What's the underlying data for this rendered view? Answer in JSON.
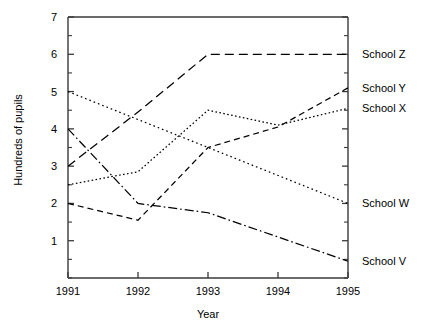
{
  "chart_data": {
    "type": "line",
    "title": "",
    "xlabel": "Year",
    "ylabel": "Hundreds of pupils",
    "x": [
      1991,
      1992,
      1993,
      1994,
      1995
    ],
    "xtick_labels": [
      "1991",
      "1992",
      "1993",
      "1994",
      "1995"
    ],
    "ytick_labels": [
      "1",
      "2",
      "3",
      "4",
      "5",
      "6",
      "7"
    ],
    "ytick_values": [
      1,
      2,
      3,
      4,
      5,
      6,
      7
    ],
    "xlim": [
      1991,
      1995
    ],
    "ylim": [
      0,
      7
    ],
    "y_minor_step": 0.5,
    "grid": false,
    "legend_position": "right-of-axes-inline",
    "series": [
      {
        "name": "School Z",
        "label": "School Z",
        "line_style": "dashed",
        "values": [
          3,
          4.45,
          6,
          6,
          6
        ]
      },
      {
        "name": "School Y",
        "label": "School Y",
        "line_style": "dashed-short",
        "values": [
          2,
          1.55,
          3.5,
          4.05,
          5.1
        ]
      },
      {
        "name": "School X",
        "label": "School X",
        "line_style": "dotted-dense",
        "values": [
          2.5,
          2.85,
          4.5,
          4.1,
          4.55
        ]
      },
      {
        "name": "School W",
        "label": "School W",
        "line_style": "dotted",
        "values": [
          5,
          4.25,
          3.5,
          2.75,
          2
        ]
      },
      {
        "name": "School V",
        "label": "School V",
        "line_style": "dash-dot",
        "values": [
          4,
          2,
          1.75,
          1.1,
          0.45
        ]
      }
    ]
  },
  "colors": {
    "axis": "#3a3a3a",
    "line": "#000000",
    "background": "#ffffff"
  }
}
